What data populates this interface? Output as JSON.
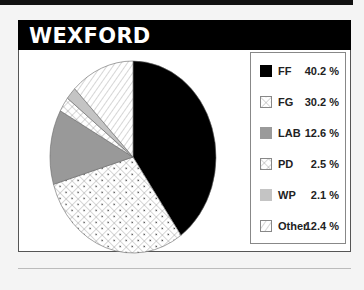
{
  "header": {
    "title": "WEXFORD"
  },
  "chart_data": {
    "type": "pie",
    "title": "WEXFORD",
    "categories": [
      "FF",
      "FG",
      "LAB",
      "PD",
      "WP",
      "Other"
    ],
    "values": [
      40.2,
      30.2,
      12.6,
      2.5,
      2.1,
      12.4
    ],
    "value_labels": [
      "40.2 %",
      "30.2 %",
      "12.6 %",
      "2.5 %",
      "2.1 %",
      "12.4 %"
    ],
    "fills": [
      "solid-black",
      "crosshatch-dotted",
      "solid-gray",
      "crosshatch",
      "solid-lightgray",
      "diagonal-hatch"
    ],
    "colors": [
      "#000000",
      "#ffffff",
      "#8c8c8c",
      "#ffffff",
      "#bdbdbd",
      "#ffffff"
    ],
    "legend_position": "right",
    "start_angle": "12 o'clock, clockwise"
  },
  "legend": {
    "items": [
      {
        "label": "FF",
        "value": "40.2 %"
      },
      {
        "label": "FG",
        "value": "30.2 %"
      },
      {
        "label": "LAB",
        "value": "12.6 %"
      },
      {
        "label": "PD",
        "value": "2.5 %"
      },
      {
        "label": "WP",
        "value": "2.1 %"
      },
      {
        "label": "Other",
        "value": "12.4 %"
      }
    ]
  }
}
